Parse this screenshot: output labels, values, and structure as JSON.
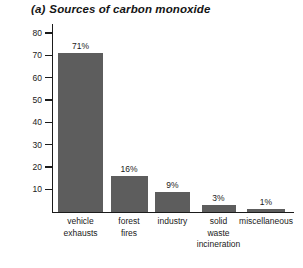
{
  "figure": {
    "title_index": "(a)",
    "title_text": "Sources of carbon monoxide"
  },
  "chart_data": {
    "type": "bar",
    "xlabel": "",
    "ylabel": "percentage (%)",
    "ylim": [
      0,
      84
    ],
    "yticks": [
      10,
      20,
      30,
      40,
      50,
      60,
      70,
      80
    ],
    "ytick_labels": [
      "10",
      "20",
      "30",
      "40",
      "50",
      "60",
      "70",
      "80"
    ],
    "grid": false,
    "legend": false,
    "bar_color": "#5d5d5d",
    "categories": [
      "vehicle exhausts",
      "forest fires",
      "industry",
      "solid waste incineration",
      "miscellaneous"
    ],
    "category_lines": [
      [
        "vehicle",
        "exhausts"
      ],
      [
        "forest",
        "fires"
      ],
      [
        "industry"
      ],
      [
        "solid",
        "waste",
        "incineration"
      ],
      [
        "miscellaneous"
      ]
    ],
    "values": [
      71,
      16,
      9,
      3,
      1
    ],
    "data_labels": [
      "71%",
      "16%",
      "9%",
      "3%",
      "1%"
    ]
  }
}
